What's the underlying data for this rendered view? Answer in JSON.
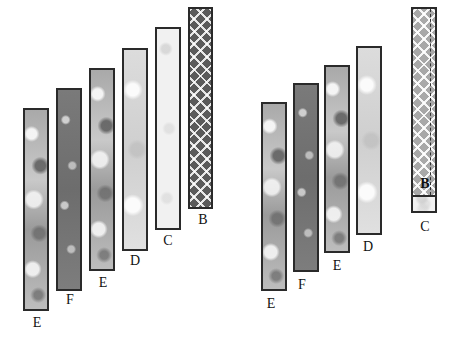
{
  "diagram": {
    "left_group": {
      "strips": [
        {
          "label": "E",
          "pattern": "floral-medium"
        },
        {
          "label": "F",
          "pattern": "floral-dark"
        },
        {
          "label": "E",
          "pattern": "floral-medium"
        },
        {
          "label": "D",
          "pattern": "floral-light"
        },
        {
          "label": "C",
          "pattern": "floral-very-light"
        },
        {
          "label": "B",
          "pattern": "plaid-dark"
        }
      ]
    },
    "right_group": {
      "strips": [
        {
          "label": "E",
          "pattern": "floral-medium"
        },
        {
          "label": "F",
          "pattern": "floral-dark"
        },
        {
          "label": "E",
          "pattern": "floral-medium"
        },
        {
          "label": "D",
          "pattern": "floral-light"
        }
      ],
      "pieced_strip": {
        "top_label": "B",
        "top_pattern": "plaid-light",
        "bottom_label": "C",
        "bottom_pattern": "floral-very-light"
      }
    }
  }
}
